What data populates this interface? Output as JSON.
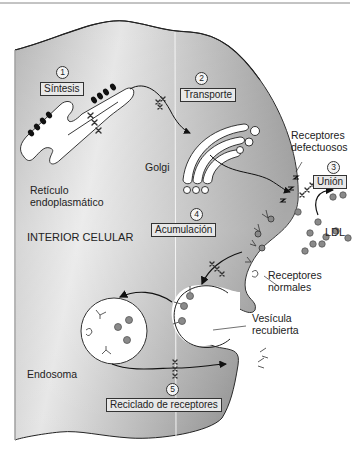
{
  "diagram": {
    "type": "cell-biology",
    "colors": {
      "cell_fill_dark": "#9c9c9c",
      "cell_fill_light": "#efefef",
      "outline": "#222222",
      "ldl_particle": "#8a8a8a",
      "label_box": "#e8e8e8"
    },
    "region_label": "INTERIOR CELULAR",
    "steps": [
      {
        "number": "1",
        "label": "Síntesis"
      },
      {
        "number": "2",
        "label": "Transporte"
      },
      {
        "number": "3",
        "label": "Unión"
      },
      {
        "number": "4",
        "label": "Acumulación"
      },
      {
        "number": "5",
        "label": "Reciclado de receptores"
      }
    ],
    "structures": {
      "er": "Retículo\nendoplasmático",
      "golgi": "Golgi",
      "defective_receptors": "Receptores\ndefectuosos",
      "ldl": "LDL",
      "normal_receptors": "Receptores\nnormales",
      "coated_vesicle": "Vesícula\nrecubierta",
      "endosome": "Endosoma"
    },
    "icons": {
      "defective_receptor_mark": "X",
      "zigzag_receptor": "zigzag",
      "normal_receptor": "Y-fork",
      "ldl_particle": "gray-dot"
    }
  }
}
